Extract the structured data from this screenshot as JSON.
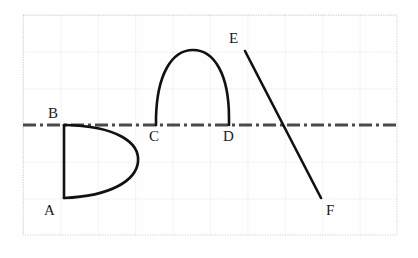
{
  "figure": {
    "background_color": "#fefefe",
    "grid": {
      "visible": true,
      "line_color": "#c9c9cf",
      "line_style": "dotted",
      "x_start": 23,
      "x_end": 397,
      "y_start": 15,
      "y_end": 235,
      "cell_width": 37.4,
      "cell_height": 36.7,
      "columns": 10,
      "rows": 6
    },
    "axis_line": {
      "name": "dash-dot-axis",
      "color": "#4a4a4a",
      "style": "dash-dot",
      "y": 125,
      "x_start": 23,
      "x_end": 397,
      "width": 3
    },
    "stroke_color": "#111111",
    "stroke_width": 2.6,
    "points": [
      {
        "label": "A",
        "x": 64,
        "y": 198,
        "label_x": 44,
        "label_y": 203
      },
      {
        "label": "B",
        "x": 64,
        "y": 125,
        "label_x": 48,
        "label_y": 106
      },
      {
        "label": "C",
        "x": 156,
        "y": 125,
        "label_x": 149,
        "label_y": 129
      },
      {
        "label": "D",
        "x": 229,
        "y": 125,
        "label_x": 223,
        "label_y": 129
      },
      {
        "label": "E",
        "x": 245,
        "y": 51,
        "label_x": 229,
        "label_y": 31
      },
      {
        "label": "F",
        "x": 321,
        "y": 198,
        "label_x": 326,
        "label_y": 203
      }
    ],
    "shapes": [
      {
        "name": "segment-ab",
        "type": "line",
        "from": "B",
        "to": "A",
        "path": "M 64 125 L 64 198"
      },
      {
        "name": "arc-b-to-a-bulge-right",
        "type": "curve",
        "from": "B",
        "to": "A",
        "rightmost_x": 138,
        "path": "M 64 125 C 118 126, 140 143, 138 162 C 136 180, 112 196, 64 198"
      },
      {
        "name": "arc-cd-semicircle",
        "type": "curve",
        "from": "C",
        "to": "D",
        "apex_x": 193,
        "apex_y": 50,
        "path": "M 156 125 L 156 118 C 157 74, 172 50, 193 50 C 214 50, 229 74, 229 118 L 229 125"
      },
      {
        "name": "segment-ef",
        "type": "line",
        "from": "E",
        "to": "F",
        "path": "M 245 51 L 321 198"
      }
    ]
  }
}
